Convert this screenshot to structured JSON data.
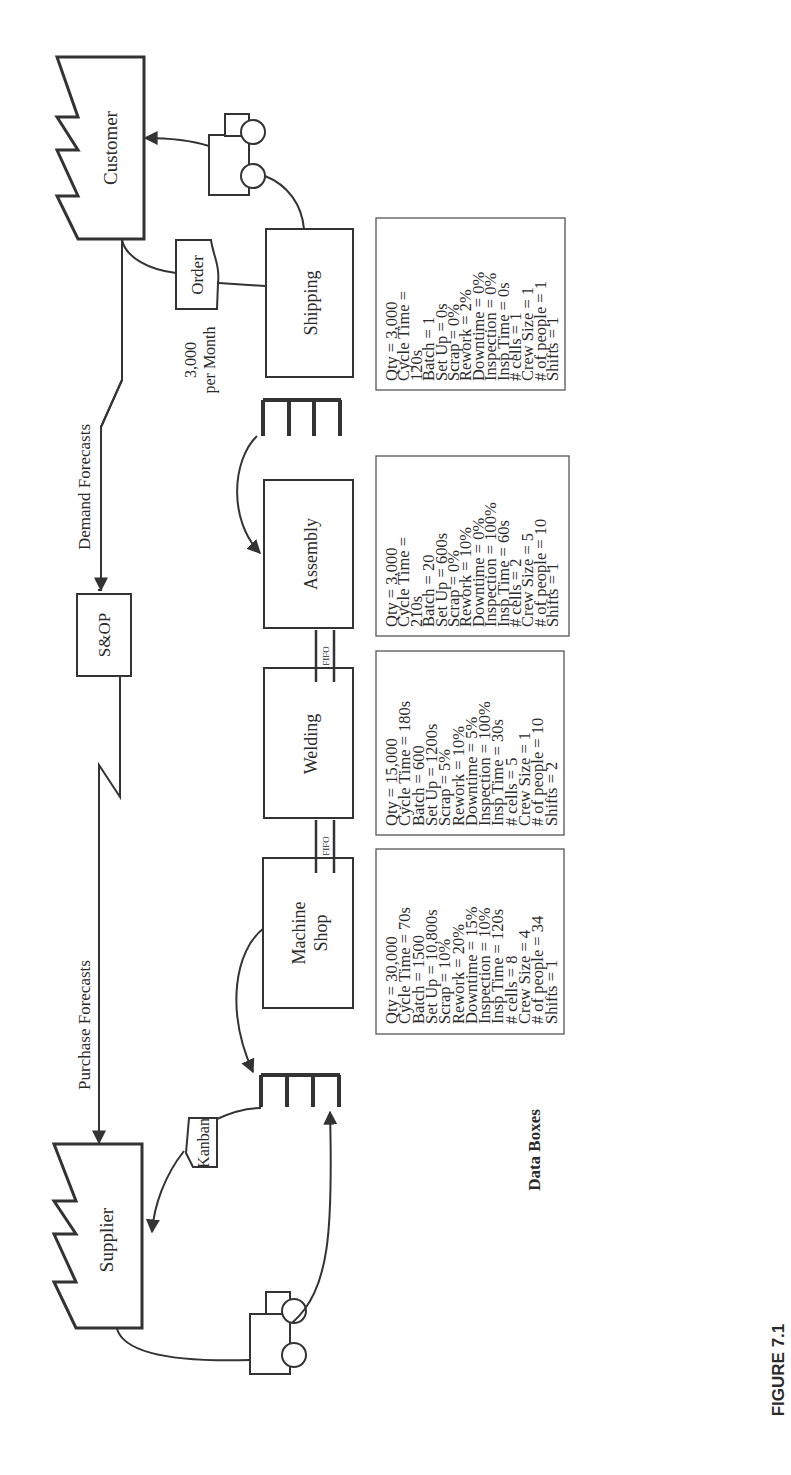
{
  "figure": {
    "caption": "FIGURE 7.1",
    "orientation": "rotated 90° counter-clockwise"
  },
  "entities": {
    "customer": "Customer",
    "supplier": "Supplier",
    "sop": "S&OP"
  },
  "processes": [
    {
      "id": "machine_shop",
      "line1": "Machine",
      "line2": "Shop"
    },
    {
      "id": "welding",
      "label": "Welding"
    },
    {
      "id": "assembly",
      "label": "Assembly"
    },
    {
      "id": "shipping",
      "label": "Shipping"
    }
  ],
  "flows": {
    "demand_forecasts": "Demand Forecasts",
    "purchase_forecasts": "Purchase Forecasts",
    "order": "Order",
    "kanban": "Kanban",
    "fifo_1": "FIFO",
    "fifo_2": "FIFO",
    "customer_demand_line1": "3,000",
    "customer_demand_line2": "per Month"
  },
  "data_boxes_label": "Data Boxes",
  "data_boxes": [
    {
      "process": "Machine Shop",
      "lines": [
        "Qty = 30,000",
        "Cycle Time = 70s",
        "Batch = 1500",
        "Set Up = 10,800s",
        "Scrap = 10%",
        "Rework = 20%",
        "Downtime = 15%",
        "Inspection = 10%",
        "Insp Time = 120s",
        "# cells = 8",
        "Crew Size = 4",
        "# of people = 34",
        "Shifts = 1"
      ]
    },
    {
      "process": "Welding",
      "lines": [
        "Qty = 15,000",
        "Cycle Time = 180s",
        "Batch = 600",
        "Set Up = 1200s",
        "Scrap = 5%",
        "Rework = 10%",
        "Downtime = 5%",
        "Inspection = 100%",
        "Insp Time = 30s",
        "# cells = 5",
        "Crew Size = 1",
        "# of people = 10",
        "Shifts = 2"
      ]
    },
    {
      "process": "Assembly",
      "lines": [
        "Qty = 3,000",
        "Cycle Time =",
        "210s",
        "Batch = 20",
        "Set Up = 600s",
        "Scrap = 0%",
        "Rework = 10%",
        "Downtime = 0%",
        "Inspection = 100%",
        "Insp Time = 60s",
        "# cells = 2",
        "Crew Size = 5",
        "# of people = 10",
        "Shifts = 1"
      ]
    },
    {
      "process": "Shipping",
      "lines": [
        "Qty = 3,000",
        "Cycle Time =",
        "120s",
        "Batch = 1",
        "Set Up = 0s",
        "Scrap = 0%",
        "Rework = 2%",
        "Downtime = 0%",
        "Inspection = 0%",
        "Insp Time = 0s",
        "# cells = 1",
        "Crew Size = 1",
        "# of people = 1",
        "Shifts = 1"
      ]
    }
  ],
  "colors": {
    "stroke": "#333333",
    "text": "#2a2a2a",
    "background": "#ffffff"
  }
}
